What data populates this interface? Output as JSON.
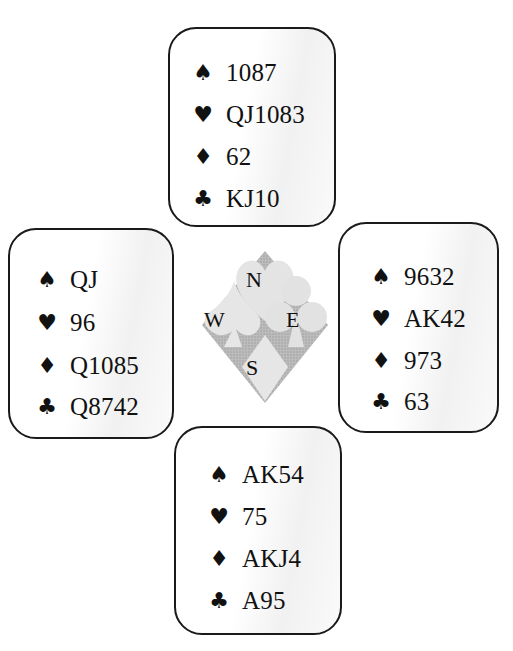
{
  "diagram": {
    "type": "bridge-deal",
    "icons": {
      "spades": "spade-icon",
      "hearts": "heart-icon",
      "diamonds": "diamond-icon",
      "clubs": "club-icon"
    },
    "suit_glyphs": {
      "spades": "♠",
      "hearts": "♥",
      "diamonds": "♦",
      "clubs": "♣"
    }
  },
  "compass": {
    "north": "N",
    "west": "W",
    "east": "E",
    "south": "S",
    "colors": {
      "dark": "#a8a8a8",
      "light": "#e2e2e2"
    }
  },
  "hands": {
    "north": {
      "spades": "1087",
      "hearts": "QJ1083",
      "diamonds": "62",
      "clubs": "KJ10"
    },
    "west": {
      "spades": "QJ",
      "hearts": "96",
      "diamonds": "Q1085",
      "clubs": "Q8742"
    },
    "east": {
      "spades": "9632",
      "hearts": "AK42",
      "diamonds": "973",
      "clubs": "63"
    },
    "south": {
      "spades": "AK54",
      "hearts": "75",
      "diamonds": "AKJ4",
      "clubs": "A95"
    }
  }
}
